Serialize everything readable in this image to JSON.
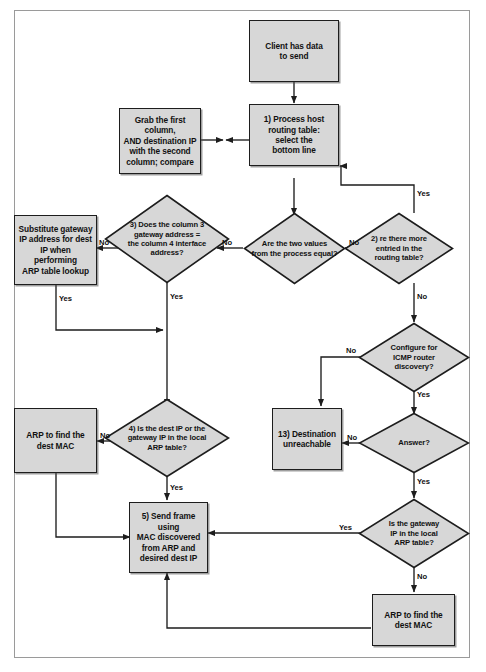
{
  "diagram": {
    "fill_color": "#d7d7d7",
    "stroke_color": "#1d1d1d",
    "frame_color": "#9a9a9a"
  },
  "nodes": [
    {
      "id": "client",
      "type": "process",
      "label": "Client has data\nto send"
    },
    {
      "id": "grab",
      "type": "process",
      "label": "Grab the first column,\nAND destination IP\nwith the second\ncolumn; compare"
    },
    {
      "id": "step1",
      "type": "process",
      "label": "1) Process host\nrouting table:\nselect the\nbottom line"
    },
    {
      "id": "substitute",
      "type": "process",
      "label": "Substitute gateway\nIP address for dest\nIP when performing\nARP table lookup"
    },
    {
      "id": "step3",
      "type": "decision",
      "label": "3) Does the column 3\ngateway address =\nthe column 4 interface\naddress?"
    },
    {
      "id": "equal",
      "type": "decision",
      "label": "Are the two values\nfrom the process equal?"
    },
    {
      "id": "step2",
      "type": "decision",
      "label": "2) re there more\nentried in the\nrouting table?"
    },
    {
      "id": "icmp",
      "type": "decision",
      "label": "Configure for\nICMP router\ndiscovery?"
    },
    {
      "id": "answer",
      "type": "decision",
      "label": "Answer?"
    },
    {
      "id": "step13",
      "type": "process",
      "label": "13) Destination\nunreachable"
    },
    {
      "id": "arpleft",
      "type": "process",
      "label": "ARP to find the\ndest MAC"
    },
    {
      "id": "step4",
      "type": "decision",
      "label": "4) Is the dest IP or the\ngateway IP in the local\nARP table?"
    },
    {
      "id": "step5",
      "type": "process",
      "label": "5) Send frame using\nMAC discovered\nfrom ARP and\ndesired dest IP"
    },
    {
      "id": "gwlocal",
      "type": "decision",
      "label": "Is the gateway\nIP in the local\nARP table?"
    },
    {
      "id": "arpright",
      "type": "process",
      "label": "ARP to find the\ndest MAC"
    }
  ],
  "edge_labels": {
    "step2_yes": "Yes",
    "step2_no": "No",
    "step2_no_down": "No",
    "equal_no": "No",
    "step3_no": "No",
    "step3_yes": "Yes",
    "substitute_yes": "Yes",
    "icmp_no": "No",
    "icmp_yes": "Yes",
    "answer_no": "No",
    "answer_yes": "Yes",
    "step4_no": "No",
    "step4_yes": "Yes",
    "gwlocal_yes": "Yes",
    "gwlocal_no": "No"
  }
}
